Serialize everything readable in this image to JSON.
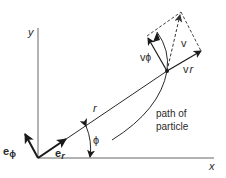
{
  "diagram": {
    "axes": {
      "x_label": "x",
      "y_label": "y"
    },
    "labels": {
      "r": "r",
      "phi": "ϕ",
      "e_r_base": "e",
      "e_r_sub": "r",
      "e_phi_base": "e",
      "e_phi_sub": "ϕ",
      "v": "v",
      "v_r_base": "v",
      "v_r_sub": "r",
      "v_phi_base": "v",
      "v_phi_sub": "ϕ",
      "path_line1": "path of",
      "path_line2": "particle"
    },
    "colors": {
      "line": "#2a2a2a",
      "axis": "#555555",
      "dashed": "#444444"
    }
  }
}
